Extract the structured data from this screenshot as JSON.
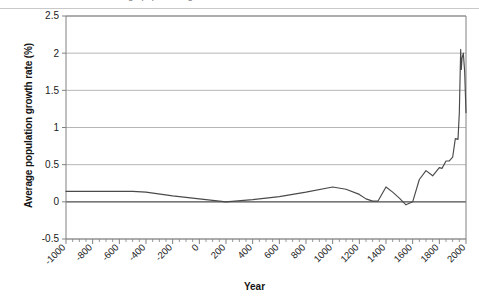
{
  "figure": {
    "caption_remnant": "Average population growth rate over time",
    "background": "#ffffff"
  },
  "chart_data": {
    "type": "line",
    "title": "",
    "xlabel": "Year",
    "ylabel": "Average population growth rate (%)",
    "xlim": [
      -1000,
      2000
    ],
    "ylim": [
      -0.5,
      2.5
    ],
    "grid": true,
    "legend": null,
    "line_color": "#4a4a4a",
    "gridline_color": "#aeaeae",
    "zero_line_color": "#4d4d4d",
    "axis_color": "#808080",
    "y_ticks": [
      -0.5,
      0,
      0.5,
      1,
      1.5,
      2,
      2.5
    ],
    "y_tick_labels": [
      "-0.5",
      "0",
      "0.5",
      "1",
      "1.5",
      "2",
      "2.5"
    ],
    "x_ticks": [
      -1000,
      -800,
      -600,
      -400,
      -200,
      0,
      200,
      400,
      600,
      800,
      1000,
      1200,
      1400,
      1600,
      1800,
      2000
    ],
    "x_tick_labels": [
      "-1000",
      "-800",
      "-600",
      "-400",
      "-200",
      "0",
      "200",
      "400",
      "600",
      "800",
      "1000",
      "1200",
      "1400",
      "1600",
      "1800",
      "2000"
    ],
    "x_minor_tick_step": 50,
    "x_tick_label_rotation": -45,
    "x": [
      -1000,
      -800,
      -500,
      -400,
      -200,
      0,
      100,
      200,
      400,
      600,
      800,
      1000,
      1100,
      1200,
      1250,
      1300,
      1340,
      1400,
      1450,
      1500,
      1550,
      1600,
      1650,
      1700,
      1750,
      1800,
      1820,
      1850,
      1875,
      1900,
      1920,
      1940,
      1950,
      1960,
      1965,
      1970,
      1980,
      1990,
      2000
    ],
    "y": [
      0.14,
      0.14,
      0.14,
      0.13,
      0.08,
      0.04,
      0.02,
      0.0,
      0.03,
      0.07,
      0.13,
      0.2,
      0.17,
      0.1,
      0.04,
      0.01,
      0.01,
      0.2,
      0.13,
      0.05,
      -0.04,
      0.0,
      0.3,
      0.42,
      0.35,
      0.46,
      0.45,
      0.55,
      0.55,
      0.6,
      0.85,
      0.84,
      1.2,
      2.05,
      1.78,
      1.93,
      2.0,
      1.75,
      1.2
    ]
  }
}
